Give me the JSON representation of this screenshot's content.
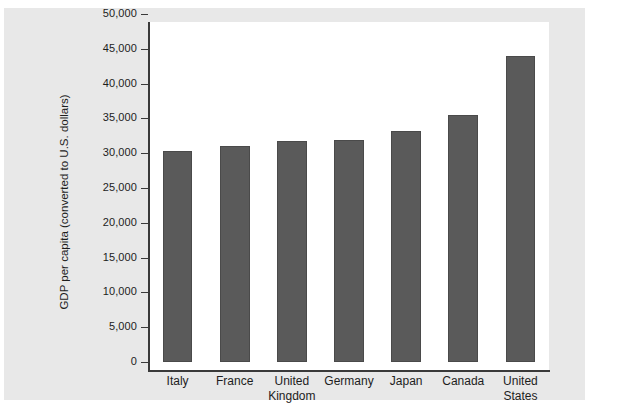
{
  "chart_data": {
    "type": "bar",
    "title": "",
    "xlabel": "",
    "ylabel": "GDP per capita (converted to U.S. dollars)",
    "categories": [
      "Italy",
      "France",
      "United\nKingdom",
      "Germany",
      "Japan",
      "Canada",
      "United\nStates"
    ],
    "values": [
      30300,
      31100,
      31800,
      31900,
      33200,
      35500,
      44000
    ],
    "ylim": [
      0,
      50000
    ],
    "ytick_values": [
      0,
      5000,
      10000,
      15000,
      20000,
      25000,
      30000,
      35000,
      40000,
      45000,
      50000
    ],
    "ytick_labels": [
      "0",
      "5,000",
      "10,000",
      "15,000",
      "20,000",
      "25,000",
      "30,000",
      "35,000",
      "40,000",
      "45,000",
      "50,000"
    ],
    "grid": false,
    "legend": null,
    "bar_color": "#5a5a5a",
    "plot_background": "#ffffff",
    "panel_background": "#e8e8e8",
    "axis_color": "#3a3a3a"
  }
}
